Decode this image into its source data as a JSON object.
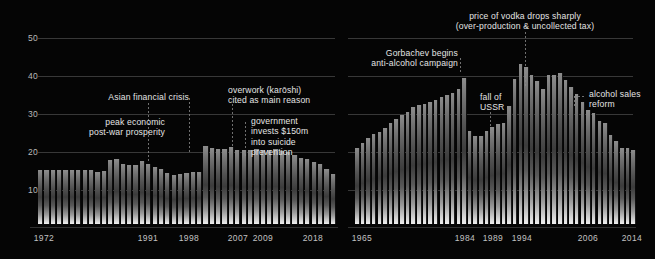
{
  "theme": {
    "background": "#000000",
    "gridline": "#4a4a4a",
    "text": "#e4e4e4",
    "bar_light": "#efefef",
    "bar_dark": "#3c3c3c"
  },
  "chart_data": [
    {
      "id": "japan",
      "type": "bar",
      "title": "",
      "xlabel": "",
      "ylabel": "",
      "ylim": [
        0,
        55
      ],
      "grid": true,
      "yticks": [
        10,
        20,
        30,
        40,
        50
      ],
      "legend": "none",
      "xtick_labels": [
        "1972",
        "1991",
        "1998",
        "2007",
        "2009",
        "2018"
      ],
      "categories": [
        "1972",
        "1973",
        "1974",
        "1975",
        "1976",
        "1977",
        "1978",
        "1979",
        "1980",
        "1981",
        "1982",
        "1983",
        "1984",
        "1985",
        "1986",
        "1987",
        "1988",
        "1989",
        "1990",
        "1991",
        "1992",
        "1993",
        "1994",
        "1995",
        "1996",
        "1997",
        "1998",
        "1999",
        "2000",
        "2001",
        "2002",
        "2003",
        "2004",
        "2005",
        "2006",
        "2007",
        "2008",
        "2009",
        "2010",
        "2011",
        "2012",
        "2013",
        "2014",
        "2015",
        "2016",
        "2017",
        "2018"
      ],
      "values": [
        14.2,
        14.3,
        14.3,
        14.2,
        14.1,
        14.2,
        14.1,
        14.3,
        14.1,
        13.8,
        14.0,
        16.9,
        17.1,
        15.9,
        15.4,
        15.5,
        16.7,
        15.9,
        15.1,
        14.5,
        13.3,
        12.9,
        13.2,
        13.4,
        13.6,
        13.7,
        20.5,
        19.9,
        19.8,
        19.7,
        20.3,
        19.6,
        19.5,
        19.6,
        19.7,
        19.6,
        19.6,
        19.7,
        19.2,
        18.9,
        18.1,
        17.5,
        17.0,
        16.4,
        15.8,
        14.6,
        13.2
      ],
      "annotations": [
        {
          "text": "peak economic\npost-war prosperity",
          "anchor_year": "1983"
        },
        {
          "text": "Asian financial crisis",
          "anchor_year": "1998"
        },
        {
          "text": "overwork (karōshi)\ncited as main reason",
          "anchor_year": "2007"
        },
        {
          "text": "government\ninvests $150m\ninto suicide\nprevention",
          "anchor_year": "2009"
        }
      ]
    },
    {
      "id": "russia",
      "type": "bar",
      "title": "",
      "xlabel": "",
      "ylabel": "",
      "ylim": [
        0,
        55
      ],
      "grid": true,
      "yticks": [
        10,
        20,
        30,
        40,
        50
      ],
      "legend": "none",
      "xtick_labels": [
        "1965",
        "1984",
        "1989",
        "1994",
        "2006",
        "2014"
      ],
      "categories": [
        "1965",
        "1966",
        "1967",
        "1968",
        "1969",
        "1970",
        "1971",
        "1972",
        "1973",
        "1974",
        "1975",
        "1976",
        "1977",
        "1978",
        "1979",
        "1980",
        "1981",
        "1982",
        "1983",
        "1984",
        "1985",
        "1986",
        "1987",
        "1988",
        "1989",
        "1990",
        "1991",
        "1992",
        "1993",
        "1994",
        "1995",
        "1996",
        "1997",
        "1998",
        "1999",
        "2000",
        "2001",
        "2002",
        "2003",
        "2004",
        "2005",
        "2006",
        "2007",
        "2008",
        "2009",
        "2010",
        "2011",
        "2012",
        "2013",
        "2014"
      ],
      "values": [
        20.0,
        21.3,
        22.6,
        23.6,
        24.2,
        25.3,
        26.5,
        27.6,
        28.6,
        29.6,
        30.7,
        31.3,
        31.6,
        32.2,
        32.6,
        33.4,
        34.0,
        34.5,
        35.6,
        38.5,
        24.5,
        23.1,
        23.2,
        24.5,
        25.6,
        26.4,
        26.5,
        31.0,
        38.1,
        42.1,
        41.4,
        39.3,
        37.6,
        35.4,
        39.1,
        39.1,
        39.7,
        38.0,
        36.1,
        34.3,
        32.2,
        30.1,
        29.1,
        27.1,
        26.5,
        23.4,
        21.8,
        20.1,
        20.1,
        19.5
      ],
      "annotations": [
        {
          "text": "Gorbachev begins\nanti-alcohol campaign",
          "anchor_year": "1984"
        },
        {
          "text": "price of vodka drops sharply\n(over-production & uncollected tax)",
          "anchor_year": "1994"
        },
        {
          "text": "fall of\nUSSR",
          "anchor_year": "1991"
        },
        {
          "text": "alcohol sales\nreform",
          "anchor_year": "2006"
        }
      ]
    }
  ]
}
